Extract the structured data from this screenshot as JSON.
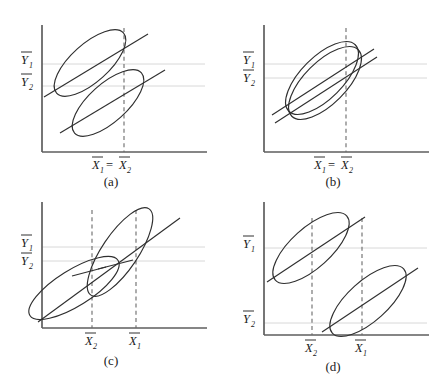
{
  "figure": {
    "title": "",
    "panel_count": 4,
    "background_color": "#ffffff",
    "stroke_color": "#2f2f2f",
    "axis_color": "#5e5e5e",
    "grid_color": "#d8d8d8",
    "dash_color": "#6a6a6a"
  },
  "labels": {
    "y1": "Y",
    "y1_sub": "1",
    "y2": "Y",
    "y2_sub": "2",
    "x1": "X",
    "x1_sub": "1",
    "x2": "X",
    "x2_sub": "2",
    "equals": "="
  },
  "panels": [
    {
      "id": "a",
      "caption": "(a)",
      "x_axis_label": "X̃1 = X̃2",
      "x_tick_labels": [
        "X̃1 = X̃2"
      ],
      "y_tick_labels": [
        "Ỹ1",
        "Ỹ2"
      ],
      "description": "Two parallel ellipses offset vertically, equal X means, different Y means",
      "ellipses": [
        {
          "cx": 90,
          "cy": 63,
          "rx": 45,
          "ry": 19,
          "angle": -42
        },
        {
          "cx": 108,
          "cy": 103,
          "rx": 45,
          "ry": 19,
          "angle": -42
        }
      ],
      "trend_lines": [
        {
          "x1": 44,
          "y1": 97,
          "x2": 148,
          "y2": 34
        },
        {
          "x1": 60,
          "y1": 133,
          "x2": 165,
          "y2": 70
        }
      ],
      "dashed_verticals": [
        124
      ],
      "grid_horizontals": [
        64,
        86
      ]
    },
    {
      "id": "b",
      "caption": "(b)",
      "x_axis_label": "X̃1 = X̃2",
      "x_tick_labels": [
        "X̃1 = X̃2"
      ],
      "y_tick_labels": [
        "Ỹ1",
        "Ỹ2"
      ],
      "description": "Two nearly coincident overlapping ellipses, equal X means, nearly equal Y means",
      "ellipses": [
        {
          "cx": 100,
          "cy": 78,
          "rx": 47,
          "ry": 21,
          "angle": -45
        },
        {
          "cx": 103,
          "cy": 83,
          "rx": 47,
          "ry": 21,
          "angle": -45
        }
      ],
      "trend_lines": [
        {
          "x1": 50,
          "y1": 115,
          "x2": 152,
          "y2": 49
        },
        {
          "x1": 53,
          "y1": 123,
          "x2": 155,
          "y2": 57
        }
      ],
      "dashed_verticals": [
        124
      ],
      "grid_horizontals": [
        64,
        78
      ]
    },
    {
      "id": "c",
      "caption": "(c)",
      "x_axis_label": "",
      "x_tick_labels": [
        "X̃2",
        "X̃1"
      ],
      "y_tick_labels": [
        "Ỹ1",
        "Ỹ2"
      ],
      "description": "Two crossing elongated ellipses sharing one trend line, X2 less than X1, Y1 greater than Y2",
      "ellipses": [
        {
          "cx": 120,
          "cy": 62,
          "rx": 52,
          "ry": 18,
          "angle": -56
        },
        {
          "cx": 74,
          "cy": 98,
          "rx": 52,
          "ry": 18,
          "angle": -32
        }
      ],
      "trend_lines": [
        {
          "x1": 38,
          "y1": 132,
          "x2": 175,
          "y2": 35
        }
      ],
      "dashed_verticals": [
        92,
        136
      ],
      "grid_horizontals": [
        57,
        71
      ]
    },
    {
      "id": "d",
      "caption": "(d)",
      "x_axis_label": "",
      "x_tick_labels": [
        "X̃2",
        "X̃1"
      ],
      "y_tick_labels": [
        "Ỹ1",
        "Ỹ2"
      ],
      "description": "Two separated parallel ellipses, X2 less than X1, Y1 much greater than Y2",
      "ellipses": [
        {
          "cx": 72,
          "cy": 58,
          "rx": 48,
          "ry": 20,
          "angle": -42
        },
        {
          "cx": 130,
          "cy": 112,
          "rx": 48,
          "ry": 20,
          "angle": -42
        }
      ],
      "trend_lines": [
        {
          "x1": 26,
          "y1": 92,
          "x2": 120,
          "y2": 28
        },
        {
          "x1": 83,
          "y1": 148,
          "x2": 178,
          "y2": 84
        }
      ],
      "dashed_verticals": [
        72,
        122
      ],
      "grid_horizontals": [
        58,
        133
      ]
    }
  ]
}
